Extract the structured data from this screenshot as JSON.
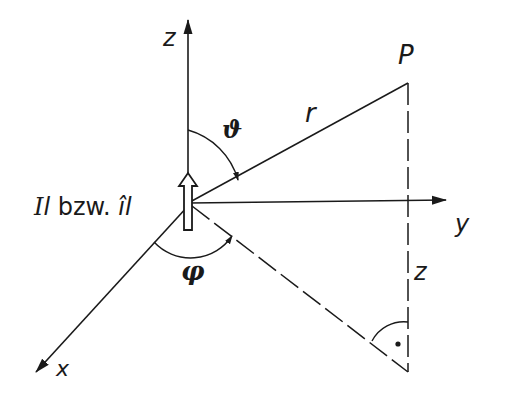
{
  "diagram": {
    "labels": {
      "z_axis": "z",
      "y_axis": "y",
      "x_axis": "x",
      "point": "P",
      "radius": "r",
      "theta": "ϑ",
      "phi": "φ",
      "height": "z",
      "source_I": "I",
      "source_l1": "l",
      "source_bzw": " bzw. ",
      "source_i_hat": "î",
      "source_l2": "l"
    },
    "colors": {
      "stroke": "#1a1a1a",
      "background": "#ffffff"
    }
  }
}
